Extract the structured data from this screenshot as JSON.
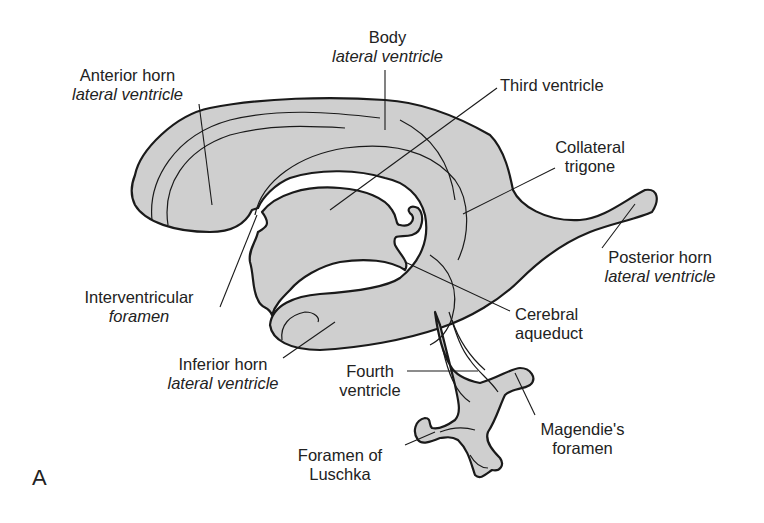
{
  "figure": {
    "panel_letter": "A",
    "fill_color": "#cfcfcf",
    "outline_color": "#1a1a1a"
  },
  "labels": {
    "body": {
      "line1": "Body",
      "line2": "lateral ventricle"
    },
    "anterior_horn": {
      "line1": "Anterior horn",
      "line2": "lateral ventricle"
    },
    "third_ventricle": {
      "line1": "Third ventricle"
    },
    "collateral_trigone": {
      "line1": "Collateral",
      "line2": "trigone"
    },
    "posterior_horn": {
      "line1": "Posterior horn",
      "line2": "lateral ventricle"
    },
    "interventricular_foramen": {
      "line1": "Interventricular",
      "line2": "foramen"
    },
    "cerebral_aqueduct": {
      "line1": "Cerebral",
      "line2": "aqueduct"
    },
    "inferior_horn": {
      "line1": "Inferior horn",
      "line2": "lateral ventricle"
    },
    "fourth_ventricle": {
      "line1": "Fourth",
      "line2": "ventricle"
    },
    "magendie_foramen": {
      "line1": "Magendie's",
      "line2": "foramen"
    },
    "foramen_luschka": {
      "line1": "Foramen of",
      "line2": "Luschka"
    }
  }
}
